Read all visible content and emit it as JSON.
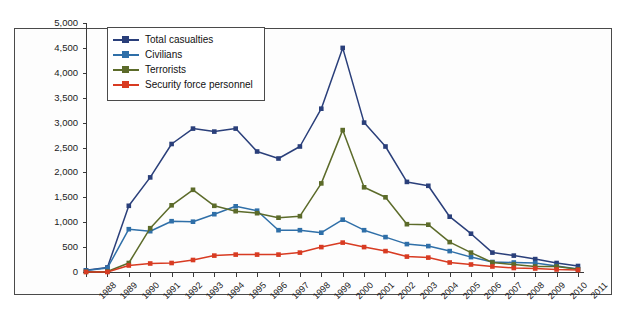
{
  "chart_data": {
    "type": "line",
    "title": "",
    "xlabel": "",
    "ylabel": "",
    "ylim": [
      0,
      5000
    ],
    "ytick_step": 500,
    "grid": false,
    "legend_position": "top-left",
    "categories": [
      "1988",
      "1989",
      "1990",
      "1991",
      "1992",
      "1993",
      "1994",
      "1995",
      "1996",
      "1997",
      "1998",
      "1999",
      "2000",
      "2001",
      "2002",
      "2003",
      "2004",
      "2005",
      "2006",
      "2007",
      "2008",
      "2009",
      "2010",
      "2011"
    ],
    "ytick_labels": [
      "0",
      "500",
      "1,000",
      "1,500",
      "2,000",
      "2,500",
      "3,000",
      "3,500",
      "4,000",
      "4,500",
      "5,000"
    ],
    "series": [
      {
        "name": "Total casualties",
        "color": "#2a3f7a",
        "values": [
          35,
          90,
          1330,
          1900,
          2570,
          2880,
          2820,
          2880,
          2420,
          2280,
          2520,
          3280,
          4500,
          3000,
          2520,
          1810,
          1730,
          1110,
          770,
          390,
          330,
          260,
          180,
          120
        ]
      },
      {
        "name": "Civilians",
        "color": "#2f6fa8",
        "values": [
          30,
          80,
          860,
          820,
          1020,
          1010,
          1160,
          1320,
          1230,
          840,
          840,
          790,
          1050,
          840,
          700,
          560,
          520,
          420,
          300,
          200,
          190,
          180,
          120,
          60
        ]
      },
      {
        "name": "Terrorists",
        "color": "#5c6b2a",
        "values": [
          5,
          10,
          180,
          880,
          1340,
          1650,
          1330,
          1220,
          1180,
          1090,
          1120,
          1780,
          2850,
          1700,
          1500,
          960,
          950,
          600,
          390,
          190,
          150,
          110,
          110,
          55
        ]
      },
      {
        "name": "Security force personnel",
        "color": "#d83b22",
        "values": [
          0,
          0,
          130,
          170,
          180,
          240,
          330,
          350,
          350,
          350,
          390,
          500,
          590,
          500,
          420,
          310,
          290,
          190,
          150,
          110,
          80,
          70,
          50,
          40
        ]
      }
    ]
  },
  "legend": {
    "items": [
      {
        "label": "Total casualties"
      },
      {
        "label": "Civilians"
      },
      {
        "label": "Terrorists"
      },
      {
        "label": "Security force personnel"
      }
    ]
  }
}
